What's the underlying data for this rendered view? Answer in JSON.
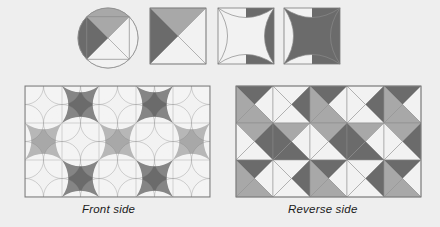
{
  "figure": {
    "background_color": "#eeeeee",
    "palette": {
      "dark": "#6b6b6b",
      "medium": "#a8a8a8",
      "light": "#d8d8d8",
      "lightest": "#f2f2f2",
      "outline": "#8a8a8a",
      "panel_edge": "#7a7a7a"
    }
  },
  "legend_row": {
    "label": "motif construction steps",
    "items": [
      {
        "name": "circle-with-inscribed-square",
        "shape": "circle",
        "x": 78,
        "y": 8,
        "size": 60,
        "quadrants": {
          "top": "medium",
          "left": "dark",
          "right": "lightest",
          "bottom": "lightest"
        }
      },
      {
        "name": "square-four-triangles",
        "shape": "square",
        "x": 150,
        "y": 8,
        "size": 56,
        "quadrants": {
          "top": "medium",
          "left": "dark",
          "right": "lightest",
          "bottom": "lightest"
        }
      },
      {
        "name": "astroid-light-on-dark-corners",
        "shape": "astroid",
        "x": 218,
        "y": 8,
        "size": 56,
        "center_fill": "lightest",
        "corner_fills": {
          "topleft": "lightest",
          "topright": "dark",
          "bottomright": "dark",
          "bottomleft": "lightest"
        }
      },
      {
        "name": "astroid-dark-on-light-corners",
        "shape": "astroid",
        "x": 284,
        "y": 8,
        "size": 56,
        "center_fill": "dark",
        "corner_fills": {
          "topleft": "lightest",
          "topright": "dark",
          "bottomright": "dark",
          "bottomleft": "lightest"
        }
      }
    ]
  },
  "panels": [
    {
      "id": "front-panel",
      "caption": "Front side",
      "x": 25,
      "y": 86,
      "cell": 37,
      "cols": 5,
      "rows": 3,
      "style": "overlapping-circles",
      "grid": [
        [
          "lightest",
          "dark",
          "lightest",
          "dark",
          "lightest"
        ],
        [
          "medium",
          "lightest",
          "medium",
          "lightest",
          "medium"
        ],
        [
          "lightest",
          "dark",
          "lightest",
          "dark",
          "lightest"
        ]
      ]
    },
    {
      "id": "reverse-panel",
      "caption": "Reverse side",
      "x": 236,
      "y": 86,
      "cell": 37,
      "cols": 5,
      "rows": 3,
      "style": "four-triangles",
      "grid": [
        [
          {
            "top": "dark",
            "right": "lightest",
            "bottom": "medium",
            "left": "medium"
          },
          {
            "top": "lightest",
            "right": "dark",
            "bottom": "lightest",
            "left": "lightest"
          },
          {
            "top": "dark",
            "right": "lightest",
            "bottom": "medium",
            "left": "medium"
          },
          {
            "top": "lightest",
            "right": "dark",
            "bottom": "lightest",
            "left": "lightest"
          },
          {
            "top": "dark",
            "right": "lightest",
            "bottom": "medium",
            "left": "medium"
          }
        ],
        [
          {
            "top": "medium",
            "right": "dark",
            "bottom": "lightest",
            "left": "lightest"
          },
          {
            "top": "medium",
            "right": "lightest",
            "bottom": "dark",
            "left": "dark"
          },
          {
            "top": "medium",
            "right": "dark",
            "bottom": "lightest",
            "left": "lightest"
          },
          {
            "top": "medium",
            "right": "lightest",
            "bottom": "dark",
            "left": "dark"
          },
          {
            "top": "medium",
            "right": "dark",
            "bottom": "lightest",
            "left": "lightest"
          }
        ],
        [
          {
            "top": "dark",
            "right": "lightest",
            "bottom": "medium",
            "left": "medium"
          },
          {
            "top": "lightest",
            "right": "dark",
            "bottom": "lightest",
            "left": "lightest"
          },
          {
            "top": "dark",
            "right": "lightest",
            "bottom": "medium",
            "left": "medium"
          },
          {
            "top": "lightest",
            "right": "dark",
            "bottom": "lightest",
            "left": "lightest"
          },
          {
            "top": "dark",
            "right": "lightest",
            "bottom": "medium",
            "left": "medium"
          }
        ]
      ]
    }
  ],
  "captions": {
    "front": "Front side",
    "reverse": "Reverse side"
  }
}
